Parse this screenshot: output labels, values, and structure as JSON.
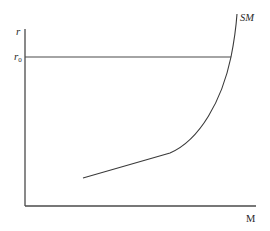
{
  "diagram": {
    "y_axis_label": "r",
    "r0_label_main": "r",
    "r0_label_sub": "0",
    "curve_label": "SM",
    "x_axis_label": "M",
    "colors": {
      "line": "#4a4a4a",
      "curve": "#3a3a3a",
      "text": "#2a2a2a",
      "background": "#ffffff"
    }
  }
}
